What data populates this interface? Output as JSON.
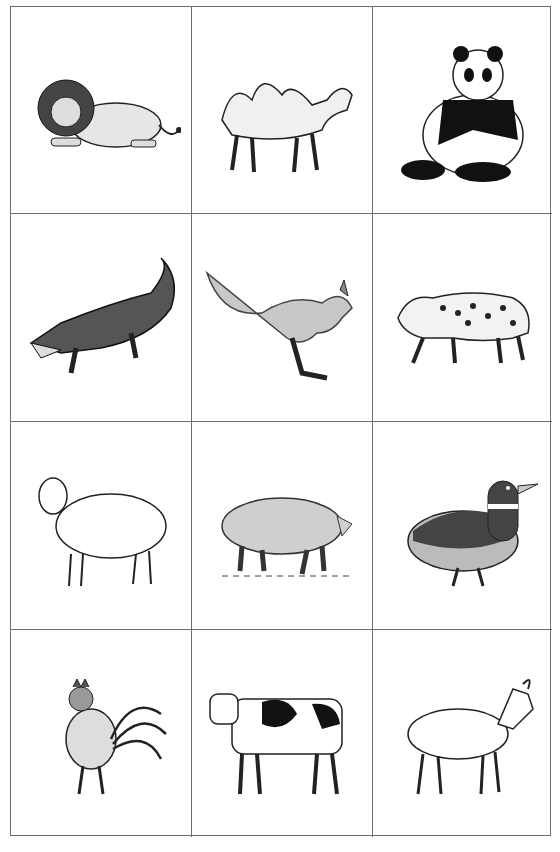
{
  "sheet": {
    "rows": 4,
    "columns": 3,
    "cards": [
      {
        "animal": "lion",
        "icon": "lion-icon"
      },
      {
        "animal": "camel",
        "icon": "camel-icon"
      },
      {
        "animal": "panda",
        "icon": "panda-icon"
      },
      {
        "animal": "crocodile",
        "icon": "crocodile-icon"
      },
      {
        "animal": "kangaroo",
        "icon": "kangaroo-icon"
      },
      {
        "animal": "leopard",
        "icon": "leopard-icon"
      },
      {
        "animal": "sheep",
        "icon": "sheep-icon"
      },
      {
        "animal": "pig",
        "icon": "pig-icon"
      },
      {
        "animal": "duck",
        "icon": "duck-icon"
      },
      {
        "animal": "rooster",
        "icon": "rooster-icon"
      },
      {
        "animal": "cow",
        "icon": "cow-icon"
      },
      {
        "animal": "goat",
        "icon": "goat-icon"
      }
    ]
  },
  "colors": {
    "grid_line": "#6e6e6e",
    "background": "#ffffff"
  }
}
